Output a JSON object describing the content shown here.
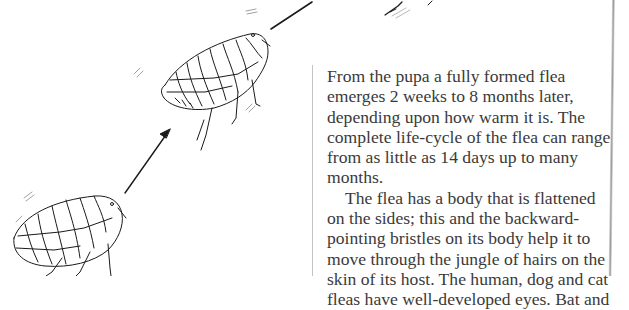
{
  "page": {
    "background": "#ffffff",
    "text_color": "#3a3a3a",
    "rule_color": "#c4c4c4"
  },
  "illustration": {
    "description": "Two line-drawn fleas jumping along arrows, showing the flea leaping upward",
    "elements": [
      "flea-lower-left",
      "arrow-up-right-lower",
      "flea-middle",
      "arrow-up-right-upper",
      "flea-legs-top-partial"
    ]
  },
  "text": {
    "paragraph1": {
      "lines": [
        "From the pupa a fully formed flea",
        "emerges 2 weeks to 8 months later,",
        "depending upon how warm it is. The",
        "complete life-cycle of the flea can range",
        "from as little as 14 days up to many",
        "months."
      ]
    },
    "paragraph2": {
      "lines": [
        "The flea has a body that is flattened",
        "on the sides; this and the backward-",
        "pointing bristles on its body help it to",
        "move through the jungle of hairs on the",
        "skin of its host. The human, dog and cat",
        "fleas have well-developed eyes. Bat and"
      ]
    }
  }
}
